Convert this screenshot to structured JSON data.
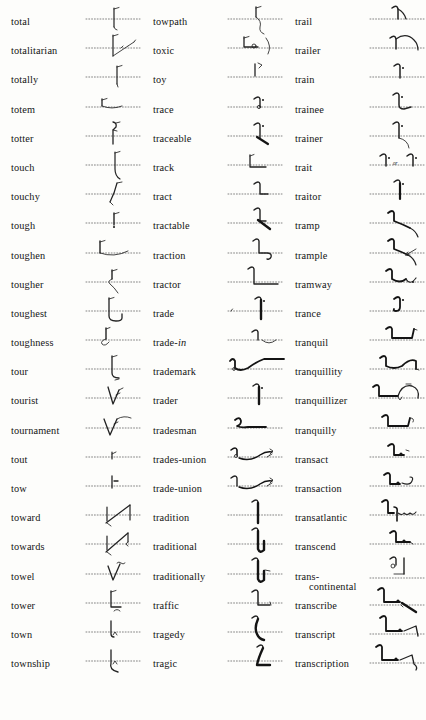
{
  "page": {
    "type": "shorthand-dictionary",
    "alphabetical_range": "total – transfer",
    "background_color": "#fdfdfb",
    "text_color": "#141414",
    "columns_count": 3,
    "rows_per_column": 23
  },
  "columns": [
    {
      "name": "column-1",
      "entries": [
        {
          "word": "total",
          "outline": "down-stroke-with-tick"
        },
        {
          "word": "totalitarian",
          "outline": "down-stroke-with-angled-ray"
        },
        {
          "word": "totally",
          "outline": "down-stroke-tick-dot"
        },
        {
          "word": "totem",
          "outline": "bracket-with-curve"
        },
        {
          "word": "totter",
          "outline": "hook-down-stroke"
        },
        {
          "word": "touch",
          "outline": "curve-down-with-tail"
        },
        {
          "word": "touchy",
          "outline": "diagonal-up-curve"
        },
        {
          "word": "tough",
          "outline": "short-down-stroke-tick"
        },
        {
          "word": "toughen",
          "outline": "bracket-with-long-curve"
        },
        {
          "word": "tougher",
          "outline": "loop-down-curve"
        },
        {
          "word": "toughest",
          "outline": "L-with-hook-loop"
        },
        {
          "word": "toughness",
          "outline": "bracket-with-curl"
        },
        {
          "word": "tour",
          "outline": "L-with-curve-tail"
        },
        {
          "word": "tourist",
          "outline": "V-with-flag"
        },
        {
          "word": "tournament",
          "outline": "V-with-flag-and-wave"
        },
        {
          "word": "tout",
          "outline": "small-hook-mark"
        },
        {
          "word": "tow",
          "outline": "vertical-tick"
        },
        {
          "word": "toward",
          "outline": "arrow-up-diagonal"
        },
        {
          "word": "towards",
          "outline": "arrow-up-diagonal-with-hook"
        },
        {
          "word": "towel",
          "outline": "V-with-tilde"
        },
        {
          "word": "tower",
          "outline": "L-with-small-curl"
        },
        {
          "word": "town",
          "outline": "down-stroke-with-caret"
        },
        {
          "word": "township",
          "outline": "down-stroke-caret-curve"
        },
        {
          "word": "townsman",
          "outline": "L-with-caret-and-loop"
        }
      ]
    },
    {
      "name": "column-2",
      "entries": [
        {
          "word": "towpath",
          "outline": "down-stroke-tick-with-wave"
        },
        {
          "word": "toxic",
          "outline": "bracket-with-circle-and-curve"
        },
        {
          "word": "toy",
          "outline": "vertical-with-flag"
        },
        {
          "word": "trace",
          "outline": "hook-stroke-with-dot"
        },
        {
          "word": "traceable",
          "outline": "hook-stroke-dot-with-bar"
        },
        {
          "word": "track",
          "outline": "L-shape"
        },
        {
          "word": "tract",
          "outline": "hook-L-shape"
        },
        {
          "word": "tractable",
          "outline": "hook-L-with-heavy-diagonal"
        },
        {
          "word": "traction",
          "outline": "hook-L-with-wave"
        },
        {
          "word": "tractor",
          "outline": "hook-long-L"
        },
        {
          "word": "trade",
          "outline": "hook-heavy-down-stroke-dot"
        },
        {
          "word": "trade-in",
          "outline": "hook-with-arc"
        },
        {
          "word": "trademark",
          "outline": "wave-rising-to-plateau"
        },
        {
          "word": "trader",
          "outline": "hook-heavy-stroke-dot"
        },
        {
          "word": "tradesman",
          "outline": "curl-with-long-tail"
        },
        {
          "word": "trades-union",
          "outline": "curl-wave-with-flag"
        },
        {
          "word": "trade-union",
          "outline": "hook-wave-with-flag"
        },
        {
          "word": "tradition",
          "outline": "hook-heavy-down-stroke"
        },
        {
          "word": "traditional",
          "outline": "hook-heavy-down-stroke-curve"
        },
        {
          "word": "traditionally",
          "outline": "hook-heavy-stroke-curve-tick"
        },
        {
          "word": "traffic",
          "outline": "hook-with-flat-base"
        },
        {
          "word": "tragedy",
          "outline": "heavy-descending-curve"
        },
        {
          "word": "tragic",
          "outline": "heavy-J-curve"
        },
        {
          "word": "tragically",
          "outline": "heavy-J-with-tick"
        }
      ]
    },
    {
      "name": "column-3",
      "entries": [
        {
          "word": "trail",
          "outline": "hook-with-down-tail"
        },
        {
          "word": "trailer",
          "outline": "hook-with-large-arc"
        },
        {
          "word": "train",
          "outline": "hook-stroke-with-dot"
        },
        {
          "word": "trainee",
          "outline": "hook-stroke-dot-with-base"
        },
        {
          "word": "trainer",
          "outline": "hook-stroke-dot-with-curve"
        },
        {
          "word": "trait",
          "outline": "two-variants-with-or",
          "alt_text": "or"
        },
        {
          "word": "traitor",
          "outline": "hook-heavy-stroke-dot"
        },
        {
          "word": "tramp",
          "outline": "hook-with-descending-curve"
        },
        {
          "word": "trample",
          "outline": "hook-curve-with-arrow"
        },
        {
          "word": "tramway",
          "outline": "hook-wave-with-tick"
        },
        {
          "word": "trance",
          "outline": "curl-with-dot"
        },
        {
          "word": "tranquil",
          "outline": "hook-long-flat-with-rise"
        },
        {
          "word": "tranquillity",
          "outline": "hook-flat-with-arc-and-tick"
        },
        {
          "word": "tranquillizer",
          "outline": "hook-flat-with-arc-loop"
        },
        {
          "word": "tranquilly",
          "outline": "hook-flat-with-curl"
        },
        {
          "word": "transact",
          "outline": "hook-with-small-circle"
        },
        {
          "word": "transaction",
          "outline": "hook-circle-with-wave"
        },
        {
          "word": "transatlantic",
          "outline": "hook-with-hook-and-wave"
        },
        {
          "word": "transcend",
          "outline": "hook-with-circle-base"
        },
        {
          "word": "trans-\ncontinental",
          "outline": "curl-stroke-stacked",
          "wrapped": true
        },
        {
          "word": "transcribe",
          "outline": "hook-flat-circle-heavy-tail"
        },
        {
          "word": "transcript",
          "outline": "hook-flat-circle-with-rise"
        },
        {
          "word": "transcription",
          "outline": "hook-flat-circle-with-wave"
        },
        {
          "word": "transfer",
          "outline": "hook-flat-with-loop-tail"
        }
      ]
    }
  ]
}
